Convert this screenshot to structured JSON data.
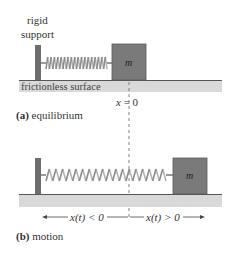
{
  "labels": {
    "rigid_support_line1": "rigid",
    "rigid_support_line2": "support",
    "surface": "frictionless surface",
    "mass_a": "m",
    "mass_b": "m",
    "x_zero": "x = 0",
    "caption_a_letter": "(a)",
    "caption_a_text": " equilibrium",
    "caption_b_letter": "(b)",
    "caption_b_text": " motion",
    "negative_region": "x(t) < 0",
    "positive_region": "x(t) > 0"
  },
  "colors": {
    "support": "#6e6e6e",
    "mass": "#7a7a7a",
    "mass_border": "#5a5a5a",
    "surface_band": "#d9d9d9",
    "surface_line": "#555555",
    "spring": "#9a9a9a",
    "text": "#333333"
  }
}
